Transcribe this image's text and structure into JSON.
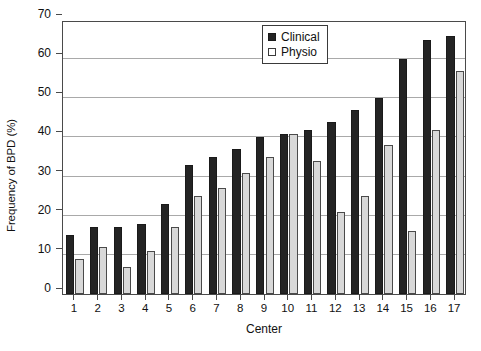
{
  "chart_data": {
    "type": "bar",
    "title": "",
    "xlabel": "Center",
    "ylabel": "Frequency of BPD (%)",
    "categories": [
      "1",
      "2",
      "3",
      "4",
      "5",
      "6",
      "7",
      "8",
      "9",
      "10",
      "11",
      "12",
      "13",
      "14",
      "15",
      "16",
      "17"
    ],
    "series": [
      {
        "name": "Clinical",
        "color": "#242424",
        "values": [
          15,
          17,
          17,
          18,
          23,
          33,
          35,
          37,
          40,
          41,
          42,
          44,
          47,
          50,
          60,
          65,
          66
        ]
      },
      {
        "name": "Physio",
        "color": "#d8d8d8",
        "values": [
          9,
          12,
          7,
          11,
          17,
          25,
          27,
          31,
          35,
          41,
          34,
          21,
          25,
          38,
          16,
          42,
          57
        ]
      }
    ],
    "ylim": [
      0,
      70
    ],
    "yticks": [
      0,
      10,
      20,
      30,
      40,
      50,
      60,
      70
    ],
    "ytick_labels": [
      "0",
      "10",
      "20",
      "30",
      "40",
      "50",
      "60",
      "70"
    ],
    "grid": "horizontal",
    "legend_position": "top-right"
  },
  "legend": {
    "entries": [
      {
        "label": "Clinical",
        "swatch": "filled-black-square"
      },
      {
        "label": "Physio",
        "swatch": "open-white-square"
      }
    ]
  },
  "axes": {
    "y_title": "Frequency of BPD (%)",
    "x_title": "Center"
  }
}
